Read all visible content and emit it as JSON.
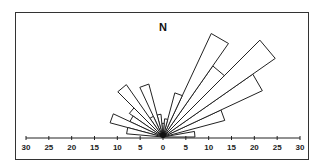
{
  "chart_data": {
    "type": "rose",
    "title": "N",
    "orientation": "half-circle, north up",
    "bin_width_deg": 10,
    "axis_ticks": [
      "30",
      "25",
      "20",
      "15",
      "10",
      "5",
      "0",
      "5",
      "10",
      "15",
      "20",
      "25",
      "30"
    ],
    "axis_range": [
      0,
      30
    ],
    "petals": [
      {
        "azimuth_deg": 85,
        "value": 7
      },
      {
        "azimuth_deg": 70,
        "value": 14
      },
      {
        "azimuth_deg": 60,
        "value": 24
      },
      {
        "azimuth_deg": 50,
        "value": 30
      },
      {
        "azimuth_deg": 40,
        "value": 19
      },
      {
        "azimuth_deg": 30,
        "value": 25
      },
      {
        "azimuth_deg": 20,
        "value": 10
      },
      {
        "azimuth_deg": 10,
        "value": 4
      },
      {
        "azimuth_deg": 0,
        "value": 3
      },
      {
        "azimuth_deg": -10,
        "value": 5
      },
      {
        "azimuth_deg": -20,
        "value": 12
      },
      {
        "azimuth_deg": -30,
        "value": 5
      },
      {
        "azimuth_deg": -40,
        "value": 14
      },
      {
        "azimuth_deg": -50,
        "value": 9
      },
      {
        "azimuth_deg": -60,
        "value": 8
      },
      {
        "azimuth_deg": -70,
        "value": 12
      },
      {
        "azimuth_deg": -80,
        "value": 8
      }
    ]
  }
}
